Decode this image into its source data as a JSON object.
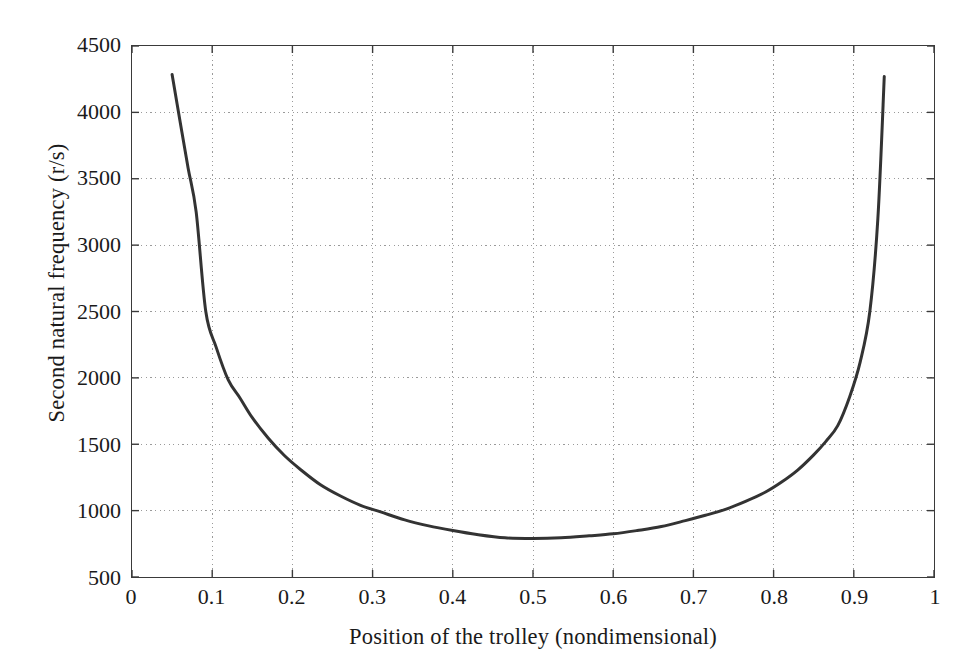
{
  "chart_data": {
    "type": "line",
    "title": "",
    "xlabel": "Position of the trolley (nondimensional)",
    "ylabel": "Second natural frequency (r/s)",
    "xlim": [
      0,
      1
    ],
    "ylim": [
      500,
      4500
    ],
    "xticks": [
      0,
      0.1,
      0.2,
      0.3,
      0.4,
      0.5,
      0.6,
      0.7,
      0.8,
      0.9,
      1
    ],
    "xticklabels": [
      "0",
      "0.1",
      "0.2",
      "0.3",
      "0.4",
      "0.5",
      "0.6",
      "0.7",
      "0.8",
      "0.9",
      "1"
    ],
    "yticks": [
      500,
      1000,
      1500,
      2000,
      2500,
      3000,
      3500,
      4000,
      4500
    ],
    "yticklabels": [
      "500",
      "1000",
      "1500",
      "2000",
      "2500",
      "3000",
      "3500",
      "4000",
      "4500"
    ],
    "grid": true,
    "grid_style": "dotted",
    "grid_color": "#9a9a9a",
    "legend": null,
    "line_color": "#333333",
    "line_width": 3,
    "series": [
      {
        "name": "Second natural frequency",
        "x": [
          0.05,
          0.06,
          0.07,
          0.08,
          0.092,
          0.105,
          0.12,
          0.135,
          0.15,
          0.17,
          0.19,
          0.21,
          0.235,
          0.26,
          0.285,
          0.31,
          0.34,
          0.37,
          0.4,
          0.43,
          0.465,
          0.5,
          0.535,
          0.57,
          0.6,
          0.63,
          0.66,
          0.69,
          0.715,
          0.74,
          0.765,
          0.79,
          0.81,
          0.83,
          0.85,
          0.865,
          0.88,
          0.895,
          0.908,
          0.92,
          0.93,
          0.938
        ],
        "y": [
          4285,
          3930,
          3580,
          3250,
          2500,
          2230,
          1985,
          1845,
          1700,
          1545,
          1415,
          1310,
          1195,
          1110,
          1040,
          990,
          930,
          885,
          850,
          820,
          795,
          790,
          795,
          810,
          825,
          850,
          880,
          925,
          965,
          1010,
          1070,
          1140,
          1215,
          1305,
          1420,
          1520,
          1640,
          1860,
          2120,
          2500,
          3200,
          4270
        ]
      }
    ]
  },
  "axes": {
    "x_axis_name": "x-axis",
    "y_axis_name": "y-axis"
  }
}
